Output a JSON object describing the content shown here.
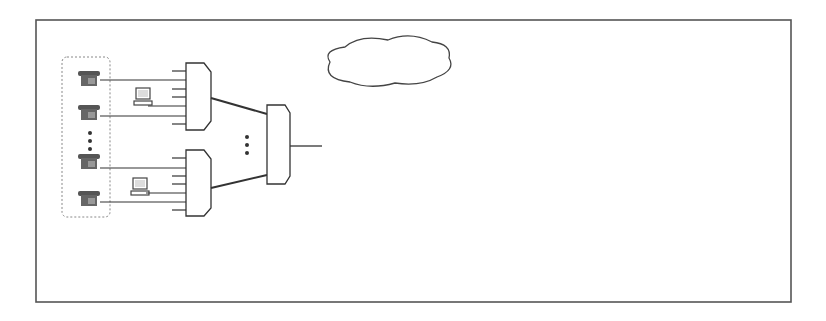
{
  "diagram": {
    "type": "network-architecture",
    "frame_color": "#555555",
    "line_color": "#333333",
    "nip_color": "#999999",
    "labels": {
      "client_lan": "Client-LAN",
      "snd_vlan": "SND-VLAN",
      "server_lan": "Server-LAN",
      "voip_vlan_1": "VoIP-",
      "voip_vlan_2": "VLAN",
      "server": "Server",
      "speichersysteme": "Speichersysteme"
    },
    "snd_vlan_nodes": [
      {
        "label": "VS"
      },
      {
        "label": "LS"
      }
    ],
    "switches": {
      "access_top_left": [
        "A",
        "S"
      ],
      "access_bottom_left": [
        "A",
        "S"
      ],
      "distribution": [
        "D",
        "S"
      ],
      "gateway": [
        "G",
        "S"
      ],
      "access_top_right": [
        "A",
        "S"
      ],
      "access_bottom_right": [
        "A",
        "S"
      ]
    },
    "core": {
      "line1": "Core-",
      "line2": "Netzwerk"
    },
    "san": [
      "S",
      "A",
      "N"
    ],
    "dmz": {
      "label": "DMZ",
      "inner": "VoIP-DMZ"
    },
    "nip_labels": [
      "NIP",
      "NIP"
    ],
    "isdn": "ISDN",
    "vg": "VG",
    "internet_access": "Internetzugang",
    "internet": "Internet",
    "ellipsis": "…"
  }
}
